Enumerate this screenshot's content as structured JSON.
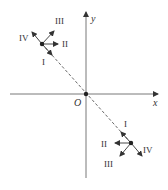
{
  "diagram": {
    "axes": {
      "x_label": "x",
      "y_label": "y",
      "origin_label": "O"
    },
    "points": [
      {
        "name": "upper-left-point",
        "arrows": [
          {
            "label": "I",
            "direction": "along dashed line toward origin"
          },
          {
            "label": "II",
            "direction": "right (+x)"
          },
          {
            "label": "III",
            "direction": "up-right"
          },
          {
            "label": "IV",
            "direction": "up-left (away from origin)"
          }
        ]
      },
      {
        "name": "lower-right-point",
        "arrows": [
          {
            "label": "I",
            "direction": "along dashed line toward origin"
          },
          {
            "label": "II",
            "direction": "left (-x)"
          },
          {
            "label": "III",
            "direction": "down-left"
          },
          {
            "label": "IV",
            "direction": "down-right (away from origin)"
          }
        ]
      }
    ],
    "colors": {
      "line": "#333333",
      "axis": "#555555"
    }
  }
}
